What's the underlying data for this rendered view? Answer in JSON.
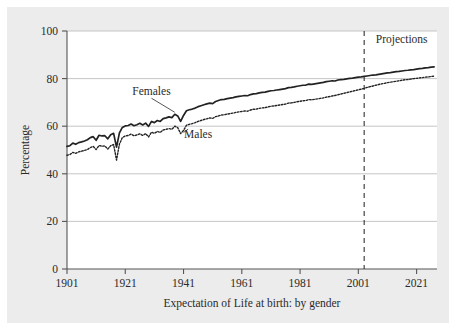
{
  "figure": {
    "background_color": "#ececec",
    "plot_background_color": "#ffffff",
    "axis_color": "#555555",
    "grid_color": "#bfbfbf",
    "series_color": "#222222"
  },
  "chart_data": {
    "type": "line",
    "title": "",
    "caption": "Expectation of Life at birth: by gender",
    "xlabel": "Expectation of Life at birth: by gender",
    "ylabel": "Percentage",
    "xlim": [
      1901,
      2028
    ],
    "ylim": [
      0,
      100
    ],
    "grid": true,
    "legend_position": "inline-annotations",
    "xticks": [
      "1901",
      "1921",
      "1941",
      "1961",
      "1981",
      "2001",
      "2021"
    ],
    "xtick_values": [
      1901,
      1921,
      1941,
      1961,
      1981,
      2001,
      2021
    ],
    "yticks": [
      "0",
      "20",
      "40",
      "60",
      "80",
      "100"
    ],
    "ytick_values": [
      0,
      20,
      40,
      60,
      80,
      100
    ],
    "annotations": [
      {
        "name": "projections",
        "text": "Projections",
        "x": 2007,
        "y": 95
      },
      {
        "name": "females",
        "text": "Females",
        "x": 1930,
        "y": 73
      },
      {
        "name": "males",
        "text": "Males",
        "x": 1946,
        "y": 55
      }
    ],
    "projection_divider": {
      "x": 2003,
      "style": "dashed",
      "label": "Projections"
    },
    "x": [
      1901,
      1902,
      1903,
      1904,
      1905,
      1906,
      1907,
      1908,
      1909,
      1910,
      1911,
      1912,
      1913,
      1914,
      1915,
      1916,
      1917,
      1918,
      1919,
      1920,
      1921,
      1922,
      1923,
      1924,
      1925,
      1926,
      1927,
      1928,
      1929,
      1930,
      1931,
      1932,
      1933,
      1934,
      1935,
      1936,
      1937,
      1938,
      1939,
      1940,
      1941,
      1942,
      1943,
      1944,
      1945,
      1946,
      1947,
      1948,
      1949,
      1950,
      1951,
      1952,
      1953,
      1954,
      1955,
      1956,
      1957,
      1958,
      1959,
      1960,
      1961,
      1962,
      1963,
      1964,
      1965,
      1966,
      1967,
      1968,
      1969,
      1970,
      1971,
      1972,
      1973,
      1974,
      1975,
      1976,
      1977,
      1978,
      1979,
      1980,
      1981,
      1982,
      1983,
      1984,
      1985,
      1986,
      1987,
      1988,
      1989,
      1990,
      1991,
      1992,
      1993,
      1994,
      1995,
      1996,
      1997,
      1998,
      1999,
      2000,
      2001,
      2002,
      2003,
      2004,
      2005,
      2006,
      2007,
      2008,
      2009,
      2010,
      2011,
      2012,
      2013,
      2014,
      2015,
      2016,
      2017,
      2018,
      2019,
      2020,
      2021,
      2022,
      2023,
      2024,
      2025,
      2026,
      2027
    ],
    "series": [
      {
        "name": "Females",
        "style": "solid",
        "values": [
          51.5,
          51.8,
          52.9,
          52.4,
          53.1,
          53.4,
          53.8,
          54.3,
          55.2,
          55.6,
          54.1,
          56.2,
          55.9,
          56.0,
          54.7,
          56.4,
          57.0,
          51.2,
          57.2,
          59.5,
          60.1,
          60.3,
          60.9,
          60.2,
          60.6,
          61.2,
          60.5,
          61.3,
          59.9,
          62.0,
          61.5,
          62.4,
          62.0,
          63.2,
          63.5,
          63.9,
          63.6,
          65.0,
          64.3,
          62.0,
          64.5,
          66.5,
          66.9,
          67.2,
          67.6,
          68.2,
          68.6,
          69.0,
          69.4,
          69.7,
          69.5,
          70.4,
          70.8,
          71.2,
          71.3,
          71.6,
          71.8,
          72.0,
          72.3,
          72.5,
          72.7,
          72.9,
          72.8,
          73.3,
          73.6,
          73.7,
          74.0,
          74.2,
          74.3,
          74.6,
          74.9,
          75.0,
          75.2,
          75.4,
          75.6,
          75.8,
          76.2,
          76.3,
          76.5,
          76.8,
          77.0,
          77.2,
          77.3,
          77.7,
          77.6,
          77.8,
          78.0,
          78.2,
          78.4,
          78.7,
          78.9,
          79.1,
          79.0,
          79.4,
          79.6,
          79.7,
          79.9,
          80.1,
          80.2,
          80.4,
          80.6,
          80.7,
          80.9,
          81.1,
          81.3,
          81.5,
          81.6,
          81.8,
          82.0,
          82.2,
          82.4,
          82.5,
          82.7,
          82.9,
          83.0,
          83.2,
          83.4,
          83.5,
          83.7,
          83.8,
          84.0,
          84.2,
          84.3,
          84.5,
          84.6,
          84.8,
          84.9
        ]
      },
      {
        "name": "Males",
        "style": "dotted",
        "values": [
          47.8,
          48.1,
          49.0,
          48.6,
          49.2,
          49.5,
          49.8,
          50.2,
          51.0,
          51.5,
          50.2,
          51.9,
          51.6,
          51.7,
          50.4,
          51.8,
          52.3,
          45.8,
          52.5,
          55.2,
          55.9,
          56.1,
          56.7,
          56.0,
          56.3,
          56.8,
          56.1,
          56.9,
          55.5,
          57.5,
          57.0,
          57.8,
          57.4,
          58.4,
          58.7,
          59.0,
          58.7,
          60.0,
          59.4,
          56.9,
          58.2,
          60.4,
          60.8,
          61.1,
          61.5,
          62.0,
          62.4,
          62.8,
          63.1,
          63.5,
          63.3,
          64.0,
          64.3,
          64.7,
          64.8,
          65.1,
          65.3,
          65.5,
          65.8,
          66.0,
          66.2,
          66.4,
          66.3,
          66.8,
          67.1,
          67.2,
          67.5,
          67.7,
          67.8,
          68.1,
          68.4,
          68.5,
          68.7,
          68.9,
          69.1,
          69.3,
          69.7,
          69.8,
          70.0,
          70.3,
          70.5,
          70.7,
          70.8,
          71.2,
          71.1,
          71.3,
          71.5,
          71.7,
          71.9,
          72.2,
          72.4,
          72.7,
          72.9,
          73.2,
          73.5,
          73.8,
          74.1,
          74.4,
          74.7,
          75.0,
          75.3,
          75.6,
          75.9,
          76.3,
          76.6,
          76.9,
          77.2,
          77.5,
          77.8,
          78.0,
          78.3,
          78.5,
          78.7,
          78.9,
          79.1,
          79.3,
          79.5,
          79.6,
          79.8,
          80.0,
          80.1,
          80.3,
          80.4,
          80.6,
          80.7,
          80.9,
          81.0
        ]
      }
    ]
  }
}
